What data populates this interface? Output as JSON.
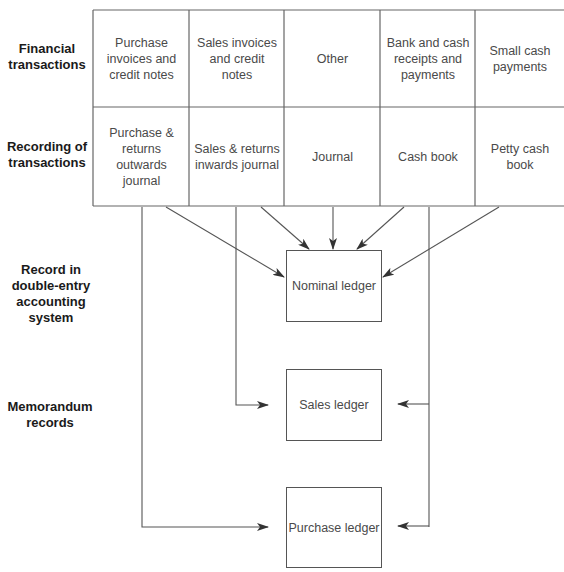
{
  "row_labels": {
    "financial": "Financial transactions",
    "recording": "Recording of transactions",
    "double_entry": "Record in double-entry accounting system",
    "memorandum": "Memorandum records"
  },
  "financial_transactions": [
    "Purchase invoices and credit notes",
    "Sales invoices and credit notes",
    "Other",
    "Bank and cash receipts and payments",
    "Small cash payments"
  ],
  "recording_of_transactions": [
    "Purchase & returns outwards journal",
    "Sales & returns inwards journal",
    "Journal",
    "Cash book",
    "Petty cash book"
  ],
  "ledgers": {
    "nominal": "Nominal ledger",
    "sales": "Sales ledger",
    "purchase": "Purchase ledger"
  },
  "colors": {
    "line": "#555555",
    "label_text": "#1a1a1a",
    "cell_text": "#4a4a4a"
  }
}
